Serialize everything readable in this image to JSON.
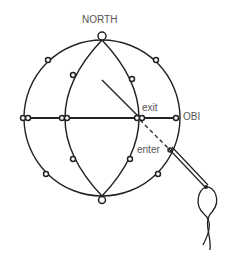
{
  "diagram": {
    "labels": {
      "north": "NORTH",
      "exit": "exit",
      "obi": "OBI",
      "enter": "enter"
    },
    "colors": {
      "line": "#222222",
      "label": "#555555",
      "background": "#ffffff"
    },
    "geometry": {
      "center": [
        102,
        118
      ],
      "radius": 78
    }
  }
}
